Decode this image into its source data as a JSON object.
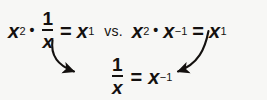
{
  "figure": {
    "background_color": "#f7f7f5",
    "ink_color": "#14110f",
    "width": 267,
    "height": 100
  },
  "expressions": {
    "left": {
      "label": "x squared times one over x equals x to the first",
      "base1": "x",
      "exp1": "2",
      "times": "•",
      "fraction_numerator": "1",
      "fraction_denominator": "x",
      "equals": "=",
      "result_base": "x",
      "result_exp": "1"
    },
    "comparator": {
      "label": "vs.",
      "text": "vs."
    },
    "right": {
      "label": "x squared times x to the negative one equals x to the first",
      "base1": "x",
      "exp1": "2",
      "times": "•",
      "base2": "x",
      "exp2": "−1",
      "equals": "=",
      "result_base": "x",
      "result_exp": "1"
    },
    "conclusion": {
      "label": "one over x equals x to the negative one",
      "fraction_numerator": "1",
      "fraction_denominator": "x",
      "equals": "=",
      "result_base": "x",
      "result_exp": "−1"
    }
  },
  "annotations": {
    "left_arrow": {
      "name": "curved arrow from one-over-x down to conclusion",
      "direction": "down-right",
      "head": "filled-triangle"
    },
    "right_arrow": {
      "name": "curved arrow from x-to-the-negative-one down to conclusion",
      "direction": "down-left",
      "head": "filled-triangle"
    }
  }
}
